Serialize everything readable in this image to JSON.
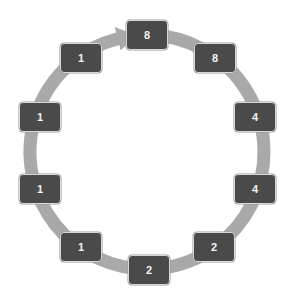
{
  "diagram": {
    "type": "cycle",
    "direction": "clockwise",
    "ring_color": "#a9a9a9",
    "node_color": "#4a4a4a",
    "node_text_color": "#f2f2f2",
    "center": {
      "x": 147,
      "y": 152
    },
    "radius": 117,
    "nodes": [
      {
        "label": "8",
        "x": 147,
        "y": 35
      },
      {
        "label": "8",
        "x": 215,
        "y": 58
      },
      {
        "label": "4",
        "x": 255,
        "y": 117
      },
      {
        "label": "4",
        "x": 255,
        "y": 189
      },
      {
        "label": "2",
        "x": 214,
        "y": 247
      },
      {
        "label": "2",
        "x": 149,
        "y": 270
      },
      {
        "label": "1",
        "x": 81,
        "y": 247
      },
      {
        "label": "1",
        "x": 40,
        "y": 189
      },
      {
        "label": "1",
        "x": 40,
        "y": 117
      },
      {
        "label": "1",
        "x": 81,
        "y": 58
      }
    ]
  }
}
